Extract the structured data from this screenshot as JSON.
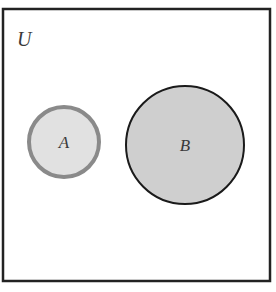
{
  "diagram": {
    "type": "venn",
    "universe": {
      "label": "U",
      "x": 3,
      "y": 9,
      "width": 267,
      "height": 272,
      "stroke": "#222222",
      "fill": "#ffffff"
    },
    "sets": [
      {
        "label": "A",
        "cx": 64,
        "cy": 142,
        "r": 35,
        "fill": "#e1e1e1",
        "stroke": "#8a8a8a",
        "stroke_width": 4
      },
      {
        "label": "B",
        "cx": 185,
        "cy": 145,
        "r": 59,
        "fill": "#cfcfcf",
        "stroke": "#1a1a1a",
        "stroke_width": 2
      }
    ],
    "relationship": "disjoint"
  }
}
